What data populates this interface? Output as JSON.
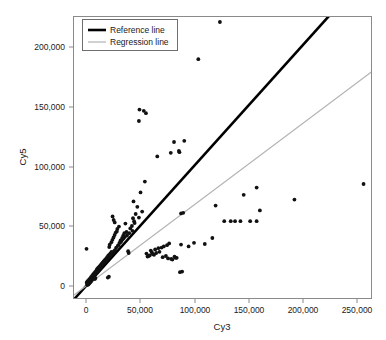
{
  "figure": {
    "type": "scatter-plot",
    "background": "#ffffff",
    "frame_color": "#8a8a8a"
  },
  "legend": {
    "position": "top-left",
    "items": [
      {
        "label": "Reference line",
        "color": "#000000",
        "width": 2.6,
        "name": "reference-line"
      },
      {
        "label": "Regression line",
        "color": "#b3b3b3",
        "width": 1.2,
        "name": "regression-line"
      }
    ]
  },
  "chart_data": {
    "type": "scatter",
    "title": "",
    "xlabel": "Cy3",
    "ylabel": "Cy5",
    "xlim": [
      -12000,
      272000
    ],
    "ylim": [
      -12000,
      232000
    ],
    "xticks": [
      0,
      50000,
      100000,
      150000,
      200000,
      250000
    ],
    "xtick_labels": [
      "0",
      "50,000",
      "100,000",
      "150,000",
      "200,000",
      "250,000"
    ],
    "yticks": [
      0,
      50000,
      100000,
      150000,
      200000
    ],
    "ytick_labels": [
      "0",
      "50,000",
      "100,000",
      "150,000",
      "200,000"
    ],
    "grid": false,
    "legend_position": "top-left",
    "point_color": "#111111",
    "point_size": 2.0,
    "lines": [
      {
        "name": "Reference line",
        "slope": 1.0,
        "intercept": 0,
        "color": "#000000",
        "width": 2.6
      },
      {
        "name": "Regression line",
        "slope": 0.675,
        "intercept": 0,
        "color": "#b3b3b3",
        "width": 1.2
      }
    ],
    "x": [
      124000,
      104000,
      49500,
      53500,
      49000,
      55500,
      81500,
      86500,
      91000,
      66000,
      78500,
      86000,
      88000,
      54500,
      50500,
      44000,
      36500,
      47500,
      46000,
      49000,
      52000,
      44500,
      146000,
      158000,
      193000,
      257000,
      120000,
      143000,
      158000,
      90000,
      134000,
      152000,
      161000,
      128000,
      138000,
      117000,
      88000,
      100000,
      95000,
      110000,
      43000,
      40000,
      35000,
      38000,
      33000,
      31000,
      41000,
      36000,
      30000,
      28000,
      34000,
      42500,
      45000,
      37500,
      32500,
      29500,
      27000,
      26000,
      25000,
      24000,
      23000,
      22500,
      21000,
      20000,
      19500,
      19000,
      18000,
      17500,
      17000,
      16500,
      16000,
      15500,
      15000,
      14500,
      14000,
      13500,
      13000,
      12500,
      12000,
      11500,
      11000,
      10500,
      10000,
      9500,
      9000,
      8500,
      8000,
      7500,
      7000,
      6500,
      6000,
      5500,
      5000,
      4500,
      4000,
      3500,
      3000,
      2500,
      2000,
      1500,
      1000,
      500,
      21500,
      22000,
      23500,
      24500,
      25500,
      26500,
      27500,
      28500,
      29000,
      30500,
      31500,
      32000,
      33500,
      34500,
      35500,
      39000,
      39500,
      61000,
      63000,
      58000,
      56000,
      60000,
      64000,
      67000,
      70000,
      72000,
      75000,
      77000,
      80000,
      83000,
      57000,
      59000,
      62000,
      65000,
      68000,
      71000,
      74000,
      76000,
      79000,
      82000,
      84000,
      87000,
      89000,
      9800,
      10200,
      11200,
      12200,
      13200,
      14200,
      15200,
      16200,
      17200,
      18200,
      19200,
      20200,
      21200,
      6200,
      6800,
      7200,
      7800,
      8200,
      8800,
      5200,
      5800,
      4200,
      4800,
      3200,
      3800,
      2200,
      2800,
      1200,
      1800,
      700,
      1400,
      2600,
      3600,
      4600,
      5600,
      6600,
      7600,
      8600,
      9600,
      10600,
      11600,
      12600,
      13600,
      14600,
      15600,
      16600,
      17600,
      18600,
      19600,
      20600,
      21600,
      22600,
      23600,
      24600,
      25600,
      26600,
      43500,
      47000,
      51000,
      53000
    ],
    "y": [
      220000,
      189000,
      147000,
      146000,
      137500,
      144000,
      120000,
      111500,
      121000,
      108000,
      111000,
      112500,
      60500,
      87000,
      78000,
      70500,
      52000,
      66000,
      60000,
      57000,
      62000,
      54000,
      76000,
      82000,
      72000,
      85000,
      67000,
      54000,
      54000,
      61000,
      54000,
      54000,
      63000,
      54000,
      54000,
      40000,
      34500,
      36000,
      33000,
      35000,
      46000,
      44000,
      40000,
      42000,
      38000,
      36000,
      48000,
      41000,
      34000,
      32000,
      39000,
      50000,
      52500,
      45000,
      37000,
      33500,
      30000,
      29000,
      28000,
      27000,
      26000,
      25500,
      24000,
      23000,
      22000,
      21500,
      20500,
      20000,
      19500,
      19000,
      18500,
      18000,
      17500,
      17000,
      16000,
      15500,
      15000,
      14500,
      14000,
      13000,
      12500,
      12000,
      11500,
      11000,
      10500,
      10000,
      9500,
      9000,
      8000,
      7500,
      7000,
      6500,
      6000,
      5500,
      5000,
      4500,
      4000,
      3500,
      3000,
      2500,
      2000,
      31000,
      32500,
      34500,
      36500,
      38500,
      40500,
      42500,
      44500,
      45500,
      47500,
      49500,
      36000,
      38000,
      40000,
      42000,
      44000,
      29000,
      27500,
      28000,
      26000,
      25000,
      27000,
      29500,
      30500,
      31500,
      32000,
      33000,
      34000,
      35500,
      22000,
      23500,
      24500,
      25500,
      26500,
      27500,
      28500,
      24000,
      25000,
      23000,
      22500,
      24500,
      23500,
      11500,
      12000,
      13000,
      14000,
      15000,
      16000,
      17000,
      18000,
      19000,
      20000,
      21000,
      22000,
      23000,
      7000,
      7800,
      8200,
      9000,
      9400,
      10000,
      5800,
      6600,
      4600,
      5400,
      3600,
      4200,
      2400,
      3000,
      1300,
      2000,
      800,
      1600,
      2900,
      4000,
      5000,
      6200,
      7400,
      8400,
      9600,
      10800,
      11800,
      12800,
      14000,
      15000,
      16200,
      17400,
      18400,
      19600,
      20800,
      21800,
      22800,
      24000,
      25200,
      26200,
      27200,
      28400,
      58000,
      55000,
      53000,
      56500
    ]
  }
}
